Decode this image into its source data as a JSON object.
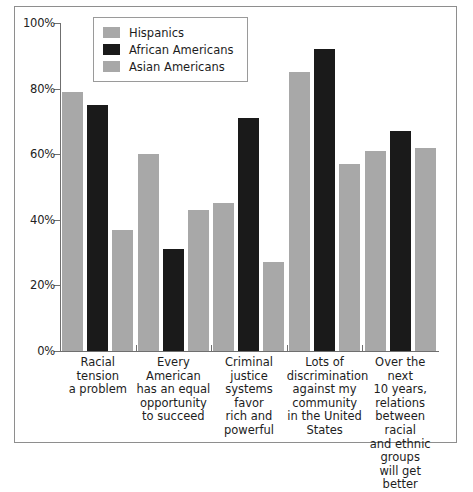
{
  "chart_data": {
    "type": "bar",
    "title": "",
    "subtitle": "",
    "xlabel": "",
    "ylabel": "",
    "ylim": [
      0,
      100
    ],
    "y_ticks": [
      "0%",
      "20%",
      "40%",
      "60%",
      "80%",
      "100%"
    ],
    "y_tick_values": [
      0,
      20,
      40,
      60,
      80,
      100
    ],
    "grid": false,
    "legend_position": "top-center",
    "categories": [
      "Racial tension a problem",
      "Every American has an equal opportunity to succeed",
      "Criminal justice systems favor rich and powerful",
      "Lots of discrimination against my community in the United States",
      "Over the next 10 years, relations between racial and ethnic groups will get better"
    ],
    "category_lines": [
      [
        "Racial tension",
        "a problem"
      ],
      [
        "Every American",
        "has an equal",
        "opportunity",
        "to succeed"
      ],
      [
        "Criminal",
        "justice",
        "systems favor",
        "rich and",
        "powerful"
      ],
      [
        "Lots of",
        "discrimination",
        "against my",
        "community",
        "in the United",
        "States"
      ],
      [
        "Over the next",
        "10 years,",
        "relations",
        "between racial",
        "and ethnic",
        "groups",
        "will get better"
      ]
    ],
    "series": [
      {
        "name": "Hispanics",
        "color": "#a8a8a8",
        "values": [
          79,
          60,
          45,
          85,
          61
        ]
      },
      {
        "name": "African Americans",
        "color": "#1a1a1a",
        "values": [
          75,
          31,
          71,
          92,
          67
        ]
      },
      {
        "name": "Asian Americans",
        "color": "#a8a8a8",
        "values": [
          37,
          43,
          27,
          57,
          62
        ]
      }
    ]
  },
  "legend": {
    "items": [
      {
        "label": "Hispanics"
      },
      {
        "label": "African Americans"
      },
      {
        "label": "Asian Americans"
      }
    ]
  }
}
